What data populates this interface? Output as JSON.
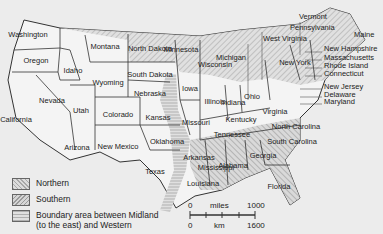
{
  "map": {
    "title": "United States dialect regions",
    "states": [
      {
        "name": "Washington",
        "x": 28,
        "y": 35
      },
      {
        "name": "Oregon",
        "x": 36,
        "y": 61
      },
      {
        "name": "California",
        "x": 16,
        "y": 120
      },
      {
        "name": "Idaho",
        "x": 73,
        "y": 71
      },
      {
        "name": "Nevada",
        "x": 52,
        "y": 101
      },
      {
        "name": "Utah",
        "x": 81,
        "y": 111
      },
      {
        "name": "Arizona",
        "x": 77,
        "y": 148
      },
      {
        "name": "Montana",
        "x": 105,
        "y": 47
      },
      {
        "name": "Wyoming",
        "x": 108,
        "y": 83
      },
      {
        "name": "Colorado",
        "x": 118,
        "y": 115
      },
      {
        "name": "New Mexico",
        "x": 118,
        "y": 147
      },
      {
        "name": "North Dakota",
        "x": 150,
        "y": 49
      },
      {
        "name": "South Dakota",
        "x": 150,
        "y": 75
      },
      {
        "name": "Nebraska",
        "x": 150,
        "y": 94
      },
      {
        "name": "Kansas",
        "x": 158,
        "y": 118
      },
      {
        "name": "Oklahoma",
        "x": 167,
        "y": 142
      },
      {
        "name": "Texas",
        "x": 155,
        "y": 172
      },
      {
        "name": "Minnesota",
        "x": 181,
        "y": 50
      },
      {
        "name": "Iowa",
        "x": 190,
        "y": 89
      },
      {
        "name": "Missouri",
        "x": 196,
        "y": 123
      },
      {
        "name": "Arkansas",
        "x": 199,
        "y": 158
      },
      {
        "name": "Louisiana",
        "x": 203,
        "y": 184
      },
      {
        "name": "Wisconsin",
        "x": 215,
        "y": 65
      },
      {
        "name": "Illinois",
        "x": 215,
        "y": 102
      },
      {
        "name": "Michigan",
        "x": 231,
        "y": 58
      },
      {
        "name": "Indiana",
        "x": 233,
        "y": 103
      },
      {
        "name": "Ohio",
        "x": 252,
        "y": 97
      },
      {
        "name": "Kentucky",
        "x": 241,
        "y": 120
      },
      {
        "name": "Tennessee",
        "x": 232,
        "y": 135
      },
      {
        "name": "Mississippi",
        "x": 216,
        "y": 168
      },
      {
        "name": "Alabama",
        "x": 233,
        "y": 166
      },
      {
        "name": "Georgia",
        "x": 263,
        "y": 156
      },
      {
        "name": "Florida",
        "x": 279,
        "y": 187
      },
      {
        "name": "North Carolina",
        "x": 296,
        "y": 127
      },
      {
        "name": "South Carolina",
        "x": 292,
        "y": 142
      },
      {
        "name": "Virginia",
        "x": 275,
        "y": 112
      },
      {
        "name": "New York",
        "x": 295,
        "y": 63
      }
    ],
    "callouts": [
      {
        "name": "Vermont",
        "x": 299,
        "y": 17
      },
      {
        "name": "Pennsylvania",
        "x": 290,
        "y": 28
      },
      {
        "name": "West Virginia",
        "x": 263,
        "y": 39
      },
      {
        "name": "Maine",
        "x": 354,
        "y": 35
      },
      {
        "name": "New Hampshire",
        "x": 324,
        "y": 49
      },
      {
        "name": "Massachusetts",
        "x": 324,
        "y": 58
      },
      {
        "name": "Rhode Island",
        "x": 324,
        "y": 66
      },
      {
        "name": "Connecticut",
        "x": 324,
        "y": 74
      },
      {
        "name": "New Jersey",
        "x": 324,
        "y": 87
      },
      {
        "name": "Delaware",
        "x": 324,
        "y": 95
      },
      {
        "name": "Maryland",
        "x": 324,
        "y": 102
      }
    ]
  },
  "legend": {
    "items": [
      {
        "label": "Northern",
        "pattern": "northern"
      },
      {
        "label": "Southern",
        "pattern": "southern"
      },
      {
        "label": "Boundary area between Midland",
        "label2": "(to the east) and Western",
        "pattern": "boundary"
      }
    ]
  },
  "scale": {
    "miles_start": "0",
    "miles_label": "miles",
    "miles_end": "1000",
    "km_start": "0",
    "km_label": "km",
    "km_end": "1600"
  },
  "colors": {
    "background": "#ececec",
    "line": "#333333",
    "hatch": "#9a9a9a",
    "land": "#f4f4f4"
  }
}
